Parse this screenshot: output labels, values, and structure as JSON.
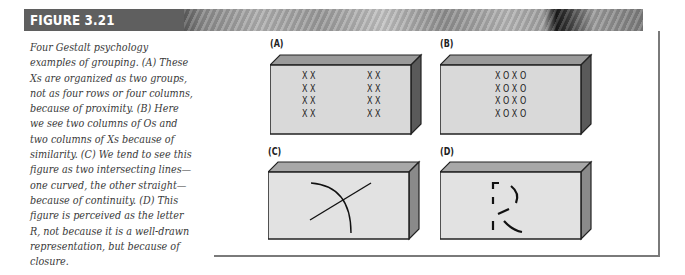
{
  "header": {
    "figure_label": "FIGURE 3.21"
  },
  "caption": {
    "text": "Four Gestalt psychology examples of grouping. (A) These Xs are organized as two groups, not as four rows or four columns, because of proximity. (B) Here we see two columns of Os and two columns of Xs because of similarity. (C) We tend to see this figure as two intersecting lines—one curved, the other straight—because of continuity. (D) This figure is perceived as the letter R, not because it is a well-drawn representation, but because of closure."
  },
  "panels": [
    {
      "label": "(A)",
      "principle": "proximity",
      "rows_left": [
        "X X",
        "X X",
        "X X",
        "X X"
      ],
      "rows_right": [
        "X X",
        "X X",
        "X X",
        "X X"
      ]
    },
    {
      "label": "(B)",
      "principle": "similarity",
      "rows": [
        "X O X O",
        "X O X O",
        "X O X O",
        "X O X O"
      ]
    },
    {
      "label": "(C)",
      "principle": "continuity"
    },
    {
      "label": "(D)",
      "principle": "closure"
    }
  ],
  "colors": {
    "header_dark": "#5f5f5f",
    "box_front": "#d9d9d9",
    "box_top": "#9a9a9a",
    "box_side": "#5a5a5a",
    "frame": "#7a7a7a",
    "caption_text": "#3a3a3a"
  }
}
